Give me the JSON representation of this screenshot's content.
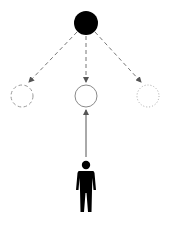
{
  "diagram": {
    "source_node": {
      "shape": "filled-circle",
      "color": "#000000",
      "cx": 86,
      "cy": 23,
      "r": 12
    },
    "options": [
      {
        "id": "left",
        "style": "dashed",
        "color": "#9a9a9a",
        "cx": 22,
        "cy": 96,
        "r": 11
      },
      {
        "id": "middle",
        "style": "solid",
        "color": "#8a8a8a",
        "cx": 86,
        "cy": 96,
        "r": 11
      },
      {
        "id": "right",
        "style": "dotted",
        "color": "#a8a8a8",
        "cx": 148,
        "cy": 96,
        "r": 11
      }
    ],
    "edges": [
      {
        "from": "source",
        "to": "left",
        "style": "dashed",
        "color": "#777777"
      },
      {
        "from": "source",
        "to": "middle",
        "style": "dashed",
        "color": "#777777"
      },
      {
        "from": "source",
        "to": "right",
        "style": "dashed",
        "color": "#777777"
      },
      {
        "from": "person",
        "to": "middle",
        "style": "solid",
        "color": "#555555"
      }
    ],
    "person": {
      "icon": "person-icon",
      "color": "#000000"
    }
  }
}
